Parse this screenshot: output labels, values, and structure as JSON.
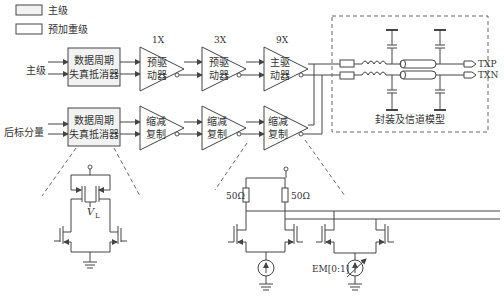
{
  "legend": {
    "items": [
      {
        "label": "主级",
        "swatch": "#f2f2f2"
      },
      {
        "label": "预加重级",
        "swatch": "#ffffff"
      }
    ]
  },
  "main_path": {
    "input_label": "主级",
    "dcd_block": {
      "line1": "数据周期",
      "line2": "失真抵消器"
    },
    "stages": [
      {
        "gain": "1X",
        "line1": "预驱",
        "line2": "动器"
      },
      {
        "gain": "3X",
        "line1": "预驱",
        "line2": "动器"
      },
      {
        "gain": "9X",
        "line1": "主驱",
        "line2": "动器"
      }
    ]
  },
  "post_path": {
    "input_label": "后标分量",
    "dcd_block": {
      "line1": "数据周期",
      "line2": "失真抵消器"
    },
    "stages": [
      {
        "line1": "缩减",
        "line2": "复制"
      },
      {
        "line1": "缩减",
        "line2": "复制"
      },
      {
        "line1": "缩减",
        "line2": "复制"
      }
    ]
  },
  "channel": {
    "label": "封装及信道模型",
    "outputs": [
      "TXP",
      "TXN"
    ]
  },
  "detail_dcd": {
    "bias_label": "V",
    "bias_sub": "L"
  },
  "detail_driver": {
    "resistors": [
      "50Ω",
      "50Ω"
    ],
    "current_source_label": "EM[0:1]"
  },
  "colors": {
    "line": "#444444",
    "block_fill": "#f2f2f2",
    "dash": "#666666"
  }
}
